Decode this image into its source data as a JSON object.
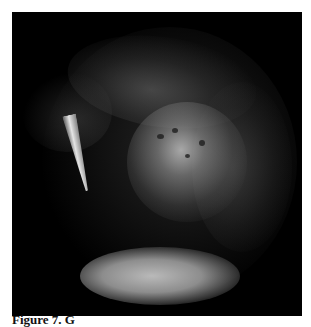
{
  "figure": {
    "image_description": "Grayscale endoscopic photograph showing a bright central mucosal lesion with dark spots, an instrument tip on the left, and a bright fluid reflection at the bottom of the field of view",
    "background_color": "#000000",
    "caption_partial": "Figure 7. G"
  }
}
